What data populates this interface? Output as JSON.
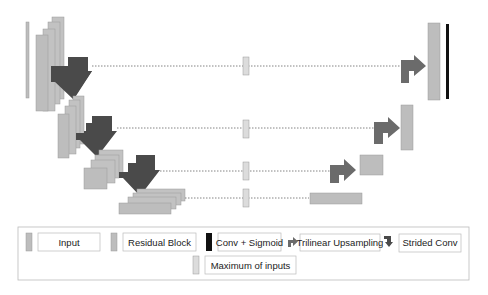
{
  "colors": {
    "block_fill": "#bdbdbd",
    "block_stroke": "#9a9a9a",
    "dark_arrow": "#4a4a4a",
    "up_arrow": "#6b6b6b",
    "sigmoid_bar": "#111111",
    "max_fill": "#dcdcdc",
    "skip_line": "#666666",
    "legend_border": "#bbbbbb"
  },
  "legend": {
    "items": [
      {
        "key": "input",
        "label": "Input"
      },
      {
        "key": "residual",
        "label": "Residual Block"
      },
      {
        "key": "conv_sigmoid",
        "label": "Conv + Sigmoid"
      },
      {
        "key": "upsampling",
        "label": "Trilinear Upsampling"
      },
      {
        "key": "strided",
        "label": "Strided Conv"
      },
      {
        "key": "maximum",
        "label": "Maximum of inputs"
      }
    ]
  },
  "levels": [
    {
      "name": "level-1",
      "skip": "skip-connection-1"
    },
    {
      "name": "level-2",
      "skip": "skip-connection-2"
    },
    {
      "name": "level-3",
      "skip": "skip-connection-3"
    },
    {
      "name": "level-4",
      "skip": "skip-connection-4"
    }
  ]
}
